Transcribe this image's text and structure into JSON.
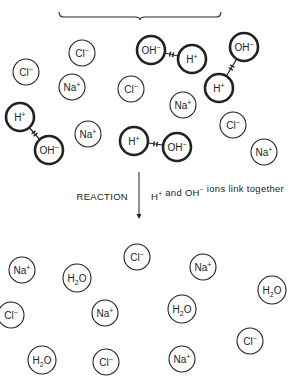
{
  "diagram": {
    "colors": {
      "stroke": "#222222",
      "background": "#ffffff"
    },
    "brace": {
      "x1": 59,
      "x2": 221,
      "y": 17,
      "tip": 140
    },
    "reactants": [
      {
        "id": "r1",
        "label": "Cl",
        "sup": "−",
        "x": 82,
        "y": 53,
        "bold": false
      },
      {
        "id": "r2",
        "label": "Cl",
        "sup": "−",
        "x": 26,
        "y": 72,
        "bold": false
      },
      {
        "id": "r3",
        "label": "Na",
        "sup": "+",
        "x": 72,
        "y": 87,
        "bold": false
      },
      {
        "id": "r4",
        "label": "Cl",
        "sup": "−",
        "x": 131,
        "y": 89,
        "bold": false
      },
      {
        "id": "r5",
        "label": "OH",
        "sup": "−",
        "x": 151,
        "y": 50,
        "bold": true
      },
      {
        "id": "r6",
        "label": "H",
        "sup": "+",
        "x": 192,
        "y": 59,
        "bold": true
      },
      {
        "id": "r7",
        "label": "OH",
        "sup": "−",
        "x": 244,
        "y": 47,
        "bold": true
      },
      {
        "id": "r8",
        "label": "H",
        "sup": "+",
        "x": 219,
        "y": 88,
        "bold": true
      },
      {
        "id": "r9",
        "label": "Na",
        "sup": "+",
        "x": 183,
        "y": 105,
        "bold": false
      },
      {
        "id": "r10",
        "label": "H",
        "sup": "+",
        "x": 20,
        "y": 117,
        "bold": true
      },
      {
        "id": "r11",
        "label": "OH",
        "sup": "−",
        "x": 49,
        "y": 150,
        "bold": true
      },
      {
        "id": "r12",
        "label": "Na",
        "sup": "+",
        "x": 88,
        "y": 134,
        "bold": false
      },
      {
        "id": "r13",
        "label": "H",
        "sup": "+",
        "x": 134,
        "y": 141,
        "bold": true
      },
      {
        "id": "r14",
        "label": "OH",
        "sup": "−",
        "x": 177,
        "y": 147,
        "bold": true
      },
      {
        "id": "r15",
        "label": "Cl",
        "sup": "−",
        "x": 233,
        "y": 125,
        "bold": false
      },
      {
        "id": "r16",
        "label": "Na",
        "sup": "+",
        "x": 264,
        "y": 152,
        "bold": false
      }
    ],
    "links": [
      [
        "r5",
        "r6"
      ],
      [
        "r7",
        "r8"
      ],
      [
        "r10",
        "r11"
      ],
      [
        "r13",
        "r14"
      ]
    ],
    "arrow": {
      "x": 139,
      "y1": 172,
      "y2": 219
    },
    "reaction_label": "REACTION",
    "reaction_note_parts": [
      {
        "t": "H",
        "sup": "+"
      },
      {
        "t": " and OH",
        "sup": "−"
      },
      {
        "t": " ions link together",
        "sup": ""
      }
    ],
    "products": [
      {
        "id": "p1",
        "label": "Na",
        "sup": "+",
        "x": 22,
        "y": 270
      },
      {
        "id": "p2",
        "label": "H2O",
        "sup": "",
        "x": 77,
        "y": 278
      },
      {
        "id": "p3",
        "label": "Cl",
        "sup": "−",
        "x": 137,
        "y": 257
      },
      {
        "id": "p4",
        "label": "Na",
        "sup": "+",
        "x": 203,
        "y": 267
      },
      {
        "id": "p5",
        "label": "H2O",
        "sup": "",
        "x": 272,
        "y": 290
      },
      {
        "id": "p6",
        "label": "Cl",
        "sup": "−",
        "x": 11,
        "y": 315
      },
      {
        "id": "p7",
        "label": "Na",
        "sup": "+",
        "x": 105,
        "y": 313
      },
      {
        "id": "p8",
        "label": "H2O",
        "sup": "",
        "x": 182,
        "y": 309
      },
      {
        "id": "p9",
        "label": "Cl",
        "sup": "−",
        "x": 250,
        "y": 341
      },
      {
        "id": "p10",
        "label": "H2O",
        "sup": "",
        "x": 42,
        "y": 360
      },
      {
        "id": "p11",
        "label": "Cl",
        "sup": "−",
        "x": 106,
        "y": 362
      },
      {
        "id": "p12",
        "label": "Na",
        "sup": "+",
        "x": 182,
        "y": 359
      }
    ]
  }
}
